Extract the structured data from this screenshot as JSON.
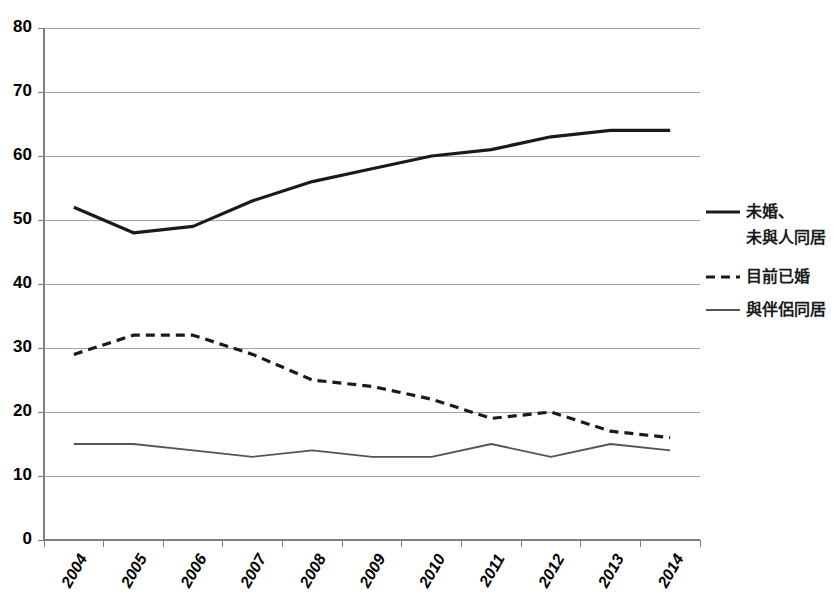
{
  "chart_data": {
    "type": "line",
    "title": "",
    "subtitle": "",
    "xlabel": "",
    "ylabel": "",
    "categories": [
      "2004",
      "2005",
      "2006",
      "2007",
      "2008",
      "2009",
      "2010",
      "2011",
      "2012",
      "2013",
      "2014"
    ],
    "ylim": [
      0,
      80
    ],
    "ytick_labels": [
      "0",
      "10",
      "20",
      "30",
      "40",
      "50",
      "60",
      "70",
      "80"
    ],
    "ytick_values": [
      0,
      10,
      20,
      30,
      40,
      50,
      60,
      70,
      80
    ],
    "grid": true,
    "grid_axis": "y",
    "legend_position": "right",
    "xtick_rotation": -60,
    "series": [
      {
        "name": "未婚、\n未與人同居",
        "legend_line1": "未婚、",
        "legend_line2": "未與人同居",
        "style": "solid-thick",
        "color": "#1a1a1a",
        "values": [
          52,
          48,
          49,
          53,
          56,
          58,
          60,
          61,
          63,
          64,
          64
        ]
      },
      {
        "name": "目前已婚",
        "legend_line1": "目前已婚",
        "legend_line2": "",
        "style": "dashed",
        "color": "#1a1a1a",
        "values": [
          29,
          32,
          32,
          29,
          25,
          24,
          22,
          19,
          20,
          17,
          16
        ]
      },
      {
        "name": "與伴侶同居",
        "legend_line1": "與伴侶同居",
        "legend_line2": "",
        "style": "solid-thin",
        "color": "#555555",
        "values": [
          15,
          15,
          14,
          13,
          14,
          13,
          13,
          15,
          13,
          15,
          14
        ]
      }
    ]
  },
  "colors": {
    "background": "#ffffff",
    "grid": "#a6a6a6",
    "axis": "#7f7f7f",
    "text": "#000000",
    "series_primary": "#1a1a1a",
    "series_secondary": "#555555"
  }
}
